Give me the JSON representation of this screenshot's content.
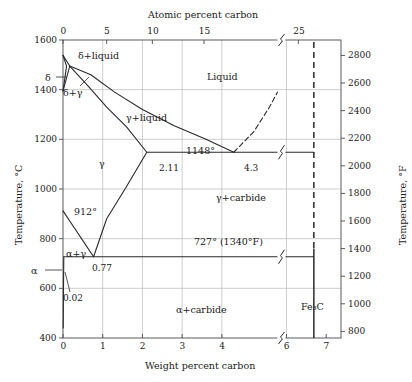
{
  "figure": {
    "top_axis_title": "Atomic percent carbon",
    "bottom_axis_title": "Weight percent carbon",
    "left_axis_title": "Temperature, °C",
    "right_axis_title": "Temperature, °F"
  },
  "axes": {
    "top_ticks": [
      {
        "label": "0",
        "wt": 0.0
      },
      {
        "label": "5",
        "wt": 1.1
      },
      {
        "label": "10",
        "wt": 2.25
      },
      {
        "label": "15",
        "wt": 3.55
      },
      {
        "label": "25",
        "wt": 6.3
      }
    ],
    "bottom_ticks": [
      {
        "label": "0",
        "wt": 0
      },
      {
        "label": "1",
        "wt": 1
      },
      {
        "label": "2",
        "wt": 2
      },
      {
        "label": "3",
        "wt": 3
      },
      {
        "label": "4",
        "wt": 4
      },
      {
        "label": "6",
        "wt": 6
      },
      {
        "label": "7",
        "wt": 7
      }
    ],
    "left_ticks": [
      "1600",
      "1400",
      "1200",
      "1000",
      "800",
      "600",
      "400"
    ],
    "right_ticks": [
      "2800",
      "2600",
      "2400",
      "2200",
      "2000",
      "1800",
      "1600",
      "1400",
      "1200",
      "1000",
      "800"
    ],
    "x_range": [
      0,
      7
    ],
    "y_range_c": [
      400,
      1600
    ],
    "y_range_f": [
      750,
      2912
    ],
    "axis_break_x": 5.4,
    "grid": true
  },
  "regions": [
    {
      "name": "delta-plus-liquid",
      "label": "δ+liquid"
    },
    {
      "name": "delta",
      "label": "δ"
    },
    {
      "name": "delta-plus-gamma",
      "label": "δ+γ"
    },
    {
      "name": "liquid",
      "label": "Liquid"
    },
    {
      "name": "gamma-plus-liquid",
      "label": "γ+liquid"
    },
    {
      "name": "gamma",
      "label": "γ"
    },
    {
      "name": "gamma-plus-carbide",
      "label": "γ+carbide"
    },
    {
      "name": "alpha-plus-gamma",
      "label": "α+γ"
    },
    {
      "name": "alpha",
      "label": "α"
    },
    {
      "name": "alpha-plus-carbide",
      "label": "α+carbide"
    },
    {
      "name": "cementite",
      "label": "Fe₃C"
    }
  ],
  "annotations": {
    "eutectic_temp": "1148°",
    "eutectoid_temp": "727° (1340°F)",
    "gamma_alpha_temp": "912°",
    "austenite_max_c": "2.11",
    "eutectic_c": "4.3",
    "eutectoid_c": "0.77",
    "ferrite_max_c": "0.02"
  },
  "chart_data": {
    "type": "line",
    "xlabel": "Weight percent carbon",
    "ylabel": "Temperature, °C",
    "xlim": [
      0,
      7
    ],
    "ylim": [
      400,
      1600
    ],
    "grid": true,
    "legend_position": "none",
    "invariant_points": [
      {
        "name": "delta-ferrite-melting",
        "carbon": 0.0,
        "temp_c": 1538
      },
      {
        "name": "peritectic",
        "carbon": 0.17,
        "temp_c": 1495
      },
      {
        "name": "delta-max-carbon",
        "carbon": 0.09,
        "temp_c": 1495
      },
      {
        "name": "eutectic",
        "carbon": 4.3,
        "temp_c": 1148
      },
      {
        "name": "austenite-max-carbon",
        "carbon": 2.11,
        "temp_c": 1148
      },
      {
        "name": "eutectoid",
        "carbon": 0.77,
        "temp_c": 727
      },
      {
        "name": "ferrite-max-carbon",
        "carbon": 0.02,
        "temp_c": 727
      },
      {
        "name": "gamma-alpha-transformation",
        "carbon": 0.0,
        "temp_c": 912
      },
      {
        "name": "cementite",
        "carbon": 6.69,
        "temp_c": 400
      }
    ],
    "series": [
      {
        "name": "liquidus-delta",
        "style": "solid",
        "points": [
          [
            0.0,
            1538
          ],
          [
            0.17,
            1495
          ]
        ]
      },
      {
        "name": "liquidus-gamma",
        "style": "solid",
        "points": [
          [
            0.17,
            1495
          ],
          [
            0.7,
            1460
          ],
          [
            1.3,
            1390
          ],
          [
            2.0,
            1320
          ],
          [
            2.8,
            1255
          ],
          [
            3.6,
            1200
          ],
          [
            4.3,
            1148
          ]
        ]
      },
      {
        "name": "solidus-delta",
        "style": "solid",
        "points": [
          [
            0.0,
            1538
          ],
          [
            0.09,
            1495
          ]
        ]
      },
      {
        "name": "delta-gamma-solvus",
        "style": "solid",
        "points": [
          [
            0.0,
            1394
          ],
          [
            0.09,
            1495
          ]
        ]
      },
      {
        "name": "delta-gamma-lower",
        "style": "solid",
        "points": [
          [
            0.0,
            1394
          ],
          [
            0.17,
            1495
          ]
        ]
      },
      {
        "name": "solidus-austenite",
        "style": "solid",
        "points": [
          [
            0.17,
            1495
          ],
          [
            0.6,
            1420
          ],
          [
            1.1,
            1330
          ],
          [
            1.6,
            1250
          ],
          [
            2.11,
            1148
          ]
        ]
      },
      {
        "name": "eutectic-isotherm",
        "style": "solid",
        "points": [
          [
            2.11,
            1148
          ],
          [
            6.69,
            1148
          ]
        ]
      },
      {
        "name": "cementite-liquidus",
        "style": "dashed",
        "points": [
          [
            4.3,
            1148
          ],
          [
            4.8,
            1230
          ],
          [
            5.2,
            1330
          ],
          [
            5.4,
            1390
          ]
        ]
      },
      {
        "name": "acm-gamma-carbide",
        "style": "solid",
        "points": [
          [
            2.11,
            1148
          ],
          [
            1.6,
            1010
          ],
          [
            1.1,
            880
          ],
          [
            0.77,
            727
          ]
        ]
      },
      {
        "name": "a3-gamma-alpha",
        "style": "solid",
        "points": [
          [
            0.0,
            912
          ],
          [
            0.3,
            840
          ],
          [
            0.55,
            780
          ],
          [
            0.77,
            727
          ]
        ]
      },
      {
        "name": "eutectoid-isotherm",
        "style": "solid",
        "points": [
          [
            0.02,
            727
          ],
          [
            6.69,
            727
          ]
        ]
      },
      {
        "name": "alpha-solvus",
        "style": "solid",
        "points": [
          [
            0.02,
            727
          ],
          [
            0.012,
            600
          ],
          [
            0.008,
            500
          ],
          [
            0.005,
            440
          ]
        ]
      },
      {
        "name": "cementite-vertical",
        "style": "dashed-upper-solid-lower",
        "points": [
          [
            6.69,
            1600
          ],
          [
            6.69,
            400
          ]
        ]
      }
    ]
  }
}
